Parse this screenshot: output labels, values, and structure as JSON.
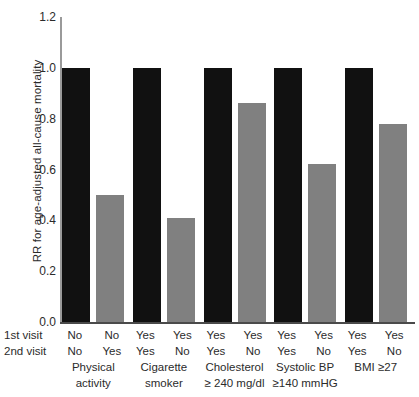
{
  "chart_data": {
    "type": "bar",
    "title": "",
    "subtitle": "",
    "xlabel": "",
    "ylabel": "RR for age-adjusted all-cause mortality",
    "ylim": [
      0.0,
      1.2
    ],
    "yticks": [
      "0.0",
      "0.2",
      "0.4",
      "0.6",
      "0.8",
      "1.0",
      "1.2"
    ],
    "ytick_values": [
      0.0,
      0.2,
      0.4,
      0.6,
      0.8,
      1.0,
      1.2
    ],
    "grid": false,
    "legend": "none",
    "row_labels": [
      "1st visit",
      "2nd visit"
    ],
    "categories": [
      "Physical activity",
      "Cigarette smoker",
      "Cholesterol ≥ 240 mg/dl",
      "Systolic BP ≥140 mmHG",
      "BMI ≥27"
    ],
    "groups": [
      {
        "name_line1": "Physical",
        "name_line2": "activity",
        "bars": [
          {
            "visit1": "No",
            "visit2": "No",
            "value": 1.0,
            "color": "#111111"
          },
          {
            "visit1": "No",
            "visit2": "Yes",
            "value": 0.5,
            "color": "#808080"
          }
        ]
      },
      {
        "name_line1": "Cigarette",
        "name_line2": "smoker",
        "bars": [
          {
            "visit1": "Yes",
            "visit2": "Yes",
            "value": 1.0,
            "color": "#111111"
          },
          {
            "visit1": "Yes",
            "visit2": "No",
            "value": 0.41,
            "color": "#808080"
          }
        ]
      },
      {
        "name_line1": "Cholesterol",
        "name_line2": "≥ 240 mg/dl",
        "bars": [
          {
            "visit1": "Yes",
            "visit2": "Yes",
            "value": 1.0,
            "color": "#111111"
          },
          {
            "visit1": "Yes",
            "visit2": "No",
            "value": 0.86,
            "color": "#808080"
          }
        ]
      },
      {
        "name_line1": "Systolic BP",
        "name_line2": "≥140 mmHG",
        "bars": [
          {
            "visit1": "Yes",
            "visit2": "Yes",
            "value": 1.0,
            "color": "#111111"
          },
          {
            "visit1": "Yes",
            "visit2": "No",
            "value": 0.62,
            "color": "#808080"
          }
        ]
      },
      {
        "name_line1": "BMI ≥27",
        "name_line2": "",
        "bars": [
          {
            "visit1": "Yes",
            "visit2": "Yes",
            "value": 1.0,
            "color": "#111111"
          },
          {
            "visit1": "Yes",
            "visit2": "No",
            "value": 0.78,
            "color": "#808080"
          }
        ]
      }
    ],
    "colors": {
      "bar_dark": "#111111",
      "bar_light": "#808080",
      "axis": "#4a4a4a",
      "yaxis": "#9a9a9a",
      "text": "#2b2b2b",
      "background": "#ffffff"
    }
  }
}
